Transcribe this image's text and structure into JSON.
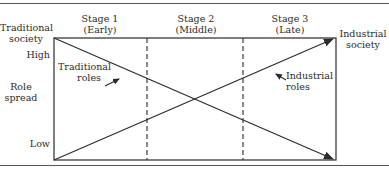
{
  "diagram": {
    "type": "role-spread-transition",
    "stages": [
      {
        "label": "Stage 1",
        "sub": "(Early)"
      },
      {
        "label": "Stage 2",
        "sub": "(Middle)"
      },
      {
        "label": "Stage 3",
        "sub": "(Late)"
      }
    ],
    "left_endpoint": {
      "line1": "Traditional",
      "line2": "society"
    },
    "right_endpoint": {
      "line1": "Industrial",
      "line2": "society"
    },
    "y_axis": {
      "label_line1": "Role",
      "label_line2": "spread",
      "high": "High",
      "low": "Low"
    },
    "series": [
      {
        "name": "traditional",
        "label_line1": "Traditional",
        "label_line2": "roles",
        "start": "High",
        "end": "Low"
      },
      {
        "name": "industrial",
        "label_line1": "Industrial",
        "label_line2": "roles",
        "start": "Low",
        "end": "High"
      }
    ],
    "colors": {
      "line": "#2a2a2a",
      "background": "#ffffff"
    }
  }
}
